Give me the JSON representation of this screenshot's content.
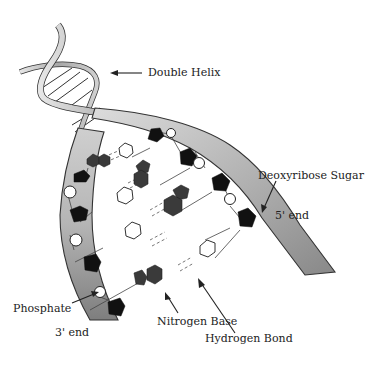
{
  "diagram": {
    "labels": {
      "double_helix": "Double Helix",
      "deoxyribose_sugar": "Deoxyribose Sugar",
      "five_prime_end": "5' end",
      "phosphate": "Phosphate",
      "three_prime_end": "3' end",
      "nitrogen_base": "Nitrogen Base",
      "hydrogen_bond": "Hydrogen Bond"
    },
    "legend_shapes": {
      "sugar": "black pentagon",
      "phosphate": "white circle",
      "nitrogen_base_purine": "dark grey fused pentagon+hexagon",
      "nitrogen_base_pyrimidine": "white hexagon",
      "hydrogen_bond": "dashed line"
    },
    "colors": {
      "strand_fill_light": "#d8d8d8",
      "strand_fill_dark": "#8a8a8a",
      "strand_outline": "#333333",
      "sugar": "#111111",
      "purine": "#3a3a3a",
      "pyrimidine": "#ffffff",
      "text": "#222222"
    }
  }
}
